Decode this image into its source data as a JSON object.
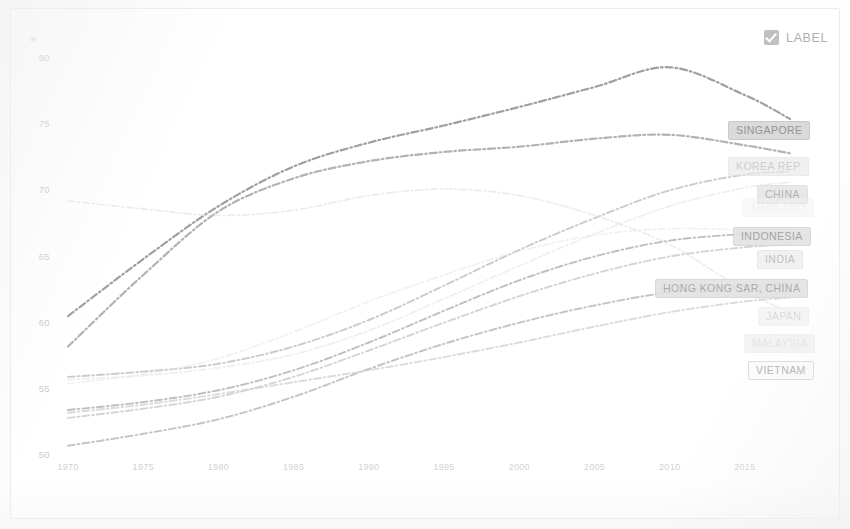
{
  "widget": {
    "label_toggle": {
      "text": "LABEL",
      "checked": true,
      "icon": "checkbox-checked-icon"
    }
  },
  "chart_data": {
    "type": "line",
    "title": "",
    "subtitle": "",
    "xlabel": "",
    "ylabel": "%",
    "unit_symbol": "%",
    "grid": false,
    "legend_position": "series-end-labels",
    "xlim": [
      1970,
      2018
    ],
    "ylim": [
      49,
      81
    ],
    "x_ticks": [
      1970,
      1975,
      1980,
      1985,
      1990,
      1995,
      2000,
      2005,
      2010,
      2015
    ],
    "y_ticks": [
      50,
      55,
      60,
      65,
      70,
      75,
      80
    ],
    "x": [
      1970,
      1975,
      1980,
      1985,
      1990,
      1995,
      2000,
      2005,
      2010,
      2015,
      2018
    ],
    "series": [
      {
        "name": "SINGAPORE",
        "label": "SINGAPORE",
        "color": "#9a9a9c",
        "emphasis": "strong",
        "values": [
          60.5,
          64.8,
          68.8,
          71.8,
          73.6,
          74.9,
          76.3,
          77.8,
          79.3,
          77.2,
          75.4
        ]
      },
      {
        "name": "KOREA REP",
        "label": "KOREA REP",
        "color": "#aeaeb0",
        "emphasis": "strong",
        "values": [
          58.2,
          63.6,
          68.4,
          70.9,
          72.2,
          72.9,
          73.3,
          73.9,
          74.2,
          73.4,
          72.8
        ]
      },
      {
        "name": "CHINA",
        "label": "CHINA",
        "color": "#c2c2c4",
        "emphasis": "medium",
        "values": [
          55.9,
          56.3,
          56.9,
          58.2,
          60.2,
          62.8,
          65.5,
          67.9,
          70.0,
          71.2,
          71.4
        ]
      },
      {
        "name": "THAILAND",
        "label": "THAILAND",
        "color": "#e0e0e2",
        "emphasis": "faint",
        "values": [
          55.7,
          56.0,
          56.6,
          57.6,
          59.4,
          61.8,
          64.3,
          66.7,
          68.8,
          70.2,
          70.6
        ]
      },
      {
        "name": "INDONESIA",
        "label": "INDONESIA",
        "color": "#b4b4b6",
        "emphasis": "medium",
        "values": [
          53.4,
          54.0,
          54.9,
          56.4,
          58.5,
          60.9,
          63.2,
          65.0,
          66.2,
          66.7,
          66.8
        ]
      },
      {
        "name": "INDIA",
        "label": "INDIA",
        "color": "#cdcdcf",
        "emphasis": "medium",
        "values": [
          52.8,
          53.5,
          54.4,
          55.9,
          57.9,
          60.0,
          62.0,
          63.7,
          65.0,
          65.7,
          65.9
        ]
      },
      {
        "name": "HONG KONG SAR, CHINA",
        "label": "HONG KONG SAR, CHINA",
        "color": "#b8b8ba",
        "emphasis": "medium",
        "values": [
          50.7,
          51.6,
          52.7,
          54.4,
          56.5,
          58.4,
          60.0,
          61.3,
          62.3,
          62.8,
          63.0
        ]
      },
      {
        "name": "JAPAN",
        "label": "JAPAN",
        "color": "#dcdcde",
        "emphasis": "faint",
        "values": [
          69.2,
          68.6,
          68.1,
          68.5,
          69.6,
          70.1,
          69.6,
          68.1,
          65.9,
          62.4,
          60.8
        ]
      },
      {
        "name": "MALAYSIA",
        "label": "MALAYSIA",
        "color": "#e6e6e8",
        "emphasis": "faint",
        "values": [
          55.4,
          56.1,
          57.3,
          59.3,
          61.6,
          63.6,
          65.4,
          66.6,
          67.1,
          67.0,
          66.9
        ]
      },
      {
        "name": "VIETNAM",
        "label": "VIETNAM",
        "color": "#d5d5d7",
        "emphasis": "medium",
        "values": [
          53.2,
          53.8,
          54.6,
          55.5,
          56.4,
          57.4,
          58.5,
          59.7,
          60.8,
          61.6,
          61.9
        ]
      }
    ],
    "end_labels": [
      {
        "text": "SINGAPORE",
        "x": 728,
        "y": 121,
        "color": "#8f8f91",
        "bg": "#d9d9db",
        "border": "#c7c7c9",
        "opacity": 0.95
      },
      {
        "text": "KOREA REP",
        "x": 728,
        "y": 157,
        "color": "#b9b9bb",
        "bg": "#eaeaec",
        "border": "#e2e2e4",
        "opacity": 0.7
      },
      {
        "text": "CHINA",
        "x": 757,
        "y": 185,
        "color": "#a6a6a8",
        "bg": "#e4e4e6",
        "border": "#dcdcde",
        "opacity": 0.85
      },
      {
        "text": "THAILAND",
        "x": 742,
        "y": 198,
        "color": "#e1e1e3",
        "bg": "#f1f1f3",
        "border": "#ececee",
        "opacity": 0.45
      },
      {
        "text": "INDONESIA",
        "x": 733,
        "y": 227,
        "color": "#9e9ea0",
        "bg": "#e3e3e5",
        "border": "#d6d6d8",
        "opacity": 0.92
      },
      {
        "text": "INDIA",
        "x": 757,
        "y": 250,
        "color": "#b3b3b5",
        "bg": "#eeeef0",
        "border": "#e3e3e5",
        "opacity": 0.8
      },
      {
        "text": "HONG KONG SAR, CHINA",
        "x": 655,
        "y": 279,
        "color": "#a2a2a4",
        "bg": "#e2e2e4",
        "border": "#d4d4d6",
        "opacity": 0.9
      },
      {
        "text": "JAPAN",
        "x": 758,
        "y": 307,
        "color": "#c4c4c6",
        "bg": "#f0f0f2",
        "border": "#e8e8ea",
        "opacity": 0.62
      },
      {
        "text": "MALAYSIA",
        "x": 744,
        "y": 334,
        "color": "#cecece",
        "bg": "#eaeaec",
        "border": "#e4e4e6",
        "opacity": 0.55
      },
      {
        "text": "VIETNAM",
        "x": 748,
        "y": 361,
        "color": "#a8a8aa",
        "bg": "#fbfbfc",
        "border": "#d8d8da",
        "opacity": 0.9
      }
    ]
  }
}
